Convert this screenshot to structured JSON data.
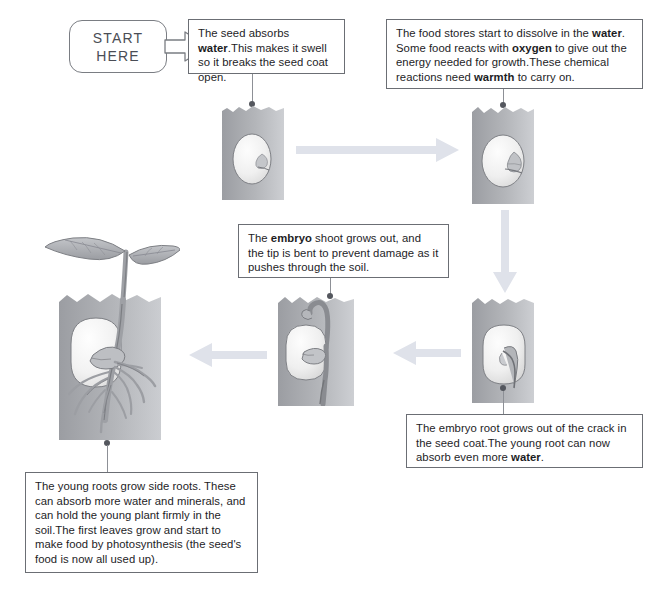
{
  "diagram": {
    "start_label_line1": "START",
    "start_label_line2": "HERE",
    "colors": {
      "arrow_fill": "#dfe2ea",
      "soil_dark": "#9a9ca1",
      "soil_light": "#c9cbcf",
      "seed_fill": "#f2f2f2",
      "plant_gray": "#9c9ea3",
      "box_border": "#6b6e74",
      "text": "#1d1d1f"
    },
    "steps": [
      {
        "id": "step-1",
        "stage": "water-absorption",
        "text_html": "The seed absorbs <b>water</b>.This makes it swell so it breaks the seed coat open.",
        "text_plain": "The seed absorbs water. This makes it swell so it breaks the seed coat open."
      },
      {
        "id": "step-2",
        "stage": "food-stores-dissolve",
        "text_html": "The food stores start to dissolve in the <b>water</b>. Some food reacts with <b>oxygen</b> to give out the energy needed for growth.These chemical reactions need <b>warmth</b> to carry on.",
        "text_plain": "The food stores start to dissolve in the water. Some food reacts with oxygen to give out the energy needed for growth. These chemical reactions need warmth to carry on."
      },
      {
        "id": "step-3",
        "stage": "embryo-root-emerges",
        "text_html": "The embryo root grows out of the crack in the seed coat.The young root can now absorb even more <b>water</b>.",
        "text_plain": "The embryo root grows out of the crack in the seed coat. The young root can now absorb even more water."
      },
      {
        "id": "step-4",
        "stage": "embryo-shoot-emerges",
        "text_html": "The <b>embryo</b> shoot grows out, and the tip is bent to prevent damage as it pushes through the soil.",
        "text_plain": "The embryo shoot grows out, and the tip is bent to prevent damage as it pushes through the soil."
      },
      {
        "id": "step-5",
        "stage": "seedling-side-roots-and-leaves",
        "text_html": "The young roots grow side roots. These can absorb more water and minerals, and can hold the young plant firmly in the soil.The first leaves grow and start to make food by photosynthesis (the seed's food is now all used up).",
        "text_plain": "The young roots grow side roots. These can absorb more water and minerals, and can hold the young plant firmly in the soil. The first leaves grow and start to make food by photosynthesis (the seed's food is now all used up)."
      }
    ],
    "panels": [
      {
        "id": "panel-1",
        "caption": "dormant seed in soil"
      },
      {
        "id": "panel-2",
        "caption": "swollen seed with split coat in soil"
      },
      {
        "id": "panel-3",
        "caption": "seed with embryo root growing down"
      },
      {
        "id": "panel-4",
        "caption": "seed with bent shoot pushing up through soil"
      },
      {
        "id": "panel-5",
        "caption": "seedling with two leaves and branching side roots"
      }
    ],
    "flow_arrows": [
      {
        "id": "arrow-1",
        "direction": "right",
        "from": "panel-1",
        "to": "panel-2"
      },
      {
        "id": "arrow-2",
        "direction": "down",
        "from": "panel-2",
        "to": "panel-3"
      },
      {
        "id": "arrow-3",
        "direction": "left",
        "from": "panel-3",
        "to": "panel-4"
      },
      {
        "id": "arrow-4",
        "direction": "left",
        "from": "panel-4",
        "to": "panel-5"
      },
      {
        "id": "arrow-start",
        "direction": "right",
        "from": "start-here",
        "to": "step-1"
      }
    ]
  }
}
